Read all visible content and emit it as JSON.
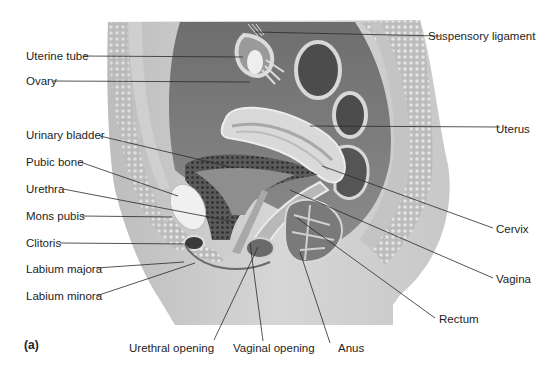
{
  "figure": {
    "panel_label": "(a)",
    "labels_left": [
      {
        "id": "uterine-tube",
        "text": "Uterine tube"
      },
      {
        "id": "ovary",
        "text": "Ovary"
      },
      {
        "id": "urinary-bladder",
        "text": "Urinary bladder"
      },
      {
        "id": "pubic-bone",
        "text": "Pubic bone"
      },
      {
        "id": "urethra",
        "text": "Urethra"
      },
      {
        "id": "mons-pubis",
        "text": "Mons pubis"
      },
      {
        "id": "clitoris",
        "text": "Clitoris"
      },
      {
        "id": "labium-majora",
        "text": "Labium majora"
      },
      {
        "id": "labium-minora",
        "text": "Labium minora"
      }
    ],
    "labels_right": [
      {
        "id": "suspensory-ligament",
        "text": "Suspensory ligament"
      },
      {
        "id": "uterus",
        "text": "Uterus"
      },
      {
        "id": "cervix",
        "text": "Cervix"
      },
      {
        "id": "vagina",
        "text": "Vagina"
      },
      {
        "id": "rectum",
        "text": "Rectum"
      }
    ],
    "labels_bottom": [
      {
        "id": "urethral-opening",
        "text": "Urethral opening"
      },
      {
        "id": "vaginal-opening",
        "text": "Vaginal opening"
      },
      {
        "id": "anus",
        "text": "Anus"
      }
    ]
  }
}
